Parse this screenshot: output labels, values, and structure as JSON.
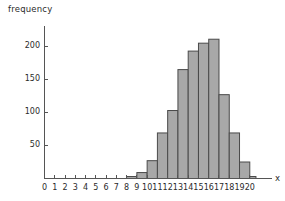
{
  "chart_data": {
    "type": "bar",
    "title": "",
    "xlabel": "x",
    "ylabel": "frequency",
    "xlim": [
      0,
      20.8
    ],
    "ylim": [
      0,
      228
    ],
    "grid": false,
    "legend": null,
    "bar_fill_color": "#a8a8a8",
    "bar_edge_color": "#4a4a4a",
    "axis_color": "#555555",
    "bin_width": 1,
    "xticks": [
      0,
      1,
      2,
      3,
      4,
      5,
      6,
      7,
      8,
      9,
      10,
      11,
      12,
      13,
      14,
      15,
      16,
      17,
      18,
      19,
      20
    ],
    "xtick_labels": [
      "0",
      "1",
      "2",
      "3",
      "4",
      "5",
      "6",
      "7",
      "8",
      "9",
      "10",
      "11",
      "12",
      "13",
      "14",
      "15",
      "16",
      "17",
      "18",
      "19",
      "20"
    ],
    "yticks": [
      50,
      100,
      150,
      200
    ],
    "ytick_labels": [
      "50",
      "100",
      "150",
      "200"
    ],
    "bins": [
      {
        "x0": 8,
        "x1": 9,
        "value": 3
      },
      {
        "x0": 9,
        "x1": 10,
        "value": 9
      },
      {
        "x0": 10,
        "x1": 11,
        "value": 27
      },
      {
        "x0": 11,
        "x1": 12,
        "value": 69
      },
      {
        "x0": 12,
        "x1": 13,
        "value": 103
      },
      {
        "x0": 13,
        "x1": 14,
        "value": 165
      },
      {
        "x0": 14,
        "x1": 15,
        "value": 193
      },
      {
        "x0": 15,
        "x1": 16,
        "value": 205
      },
      {
        "x0": 16,
        "x1": 17,
        "value": 211
      },
      {
        "x0": 17,
        "x1": 18,
        "value": 127
      },
      {
        "x0": 18,
        "x1": 19,
        "value": 69
      },
      {
        "x0": 19,
        "x1": 20,
        "value": 25
      },
      {
        "x0": 20,
        "x1": 20.6,
        "value": 3
      }
    ],
    "categories": [
      "8-9",
      "9-10",
      "10-11",
      "11-12",
      "12-13",
      "13-14",
      "14-15",
      "15-16",
      "16-17",
      "17-18",
      "18-19",
      "19-20",
      "20-20.6"
    ],
    "values": [
      3,
      9,
      27,
      69,
      103,
      165,
      193,
      205,
      211,
      127,
      69,
      25,
      3
    ]
  }
}
